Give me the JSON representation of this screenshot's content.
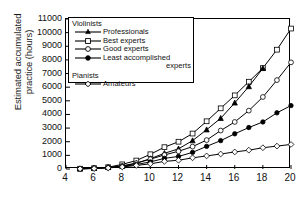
{
  "chart_data": {
    "type": "line",
    "title": "",
    "xlabel": "Age of the musicians (years)",
    "ylabel_line1": "Estimated accumulated",
    "ylabel_line2": "practice (hours)",
    "xlim": [
      4,
      20
    ],
    "ylim": [
      0,
      11000
    ],
    "xticks": [
      4,
      6,
      8,
      10,
      12,
      14,
      16,
      18,
      20
    ],
    "yticks": [
      0,
      1000,
      2000,
      3000,
      4000,
      5000,
      6000,
      7000,
      8000,
      9000,
      10000,
      11000
    ],
    "grid": false,
    "legend_position": "upper-left-inside",
    "x": [
      5,
      6,
      7,
      8,
      9,
      10,
      11,
      12,
      13,
      14,
      15,
      16,
      17,
      18,
      19,
      20
    ],
    "series": [
      {
        "name": "Best experts",
        "group": "Violinists",
        "marker": "open-square",
        "values": [
          20,
          60,
          130,
          340,
          620,
          1080,
          1600,
          2000,
          2600,
          3500,
          4450,
          5400,
          6400,
          7400,
          8750,
          10300
        ]
      },
      {
        "name": "Professionals",
        "group": "Violinists",
        "marker": "filled-triangle",
        "values": [
          20,
          55,
          120,
          200,
          420,
          760,
          1150,
          1480,
          2080,
          2880,
          3720,
          4850,
          6050,
          7380,
          null,
          null
        ]
      },
      {
        "name": "Good experts",
        "group": "Violinists",
        "marker": "open-circle",
        "values": [
          15,
          45,
          110,
          230,
          430,
          720,
          1030,
          1300,
          1640,
          2120,
          2820,
          3450,
          4280,
          5280,
          6520,
          7820
        ]
      },
      {
        "name": "Least accomplished experts",
        "group": "Violinists",
        "marker": "filled-circle",
        "values": [
          15,
          40,
          90,
          180,
          330,
          520,
          780,
          920,
          1220,
          1660,
          2080,
          2580,
          3040,
          3450,
          4120,
          4650
        ]
      },
      {
        "name": "Amateurs",
        "group": "Pianists",
        "marker": "open-diamond",
        "values": [
          15,
          35,
          80,
          150,
          260,
          380,
          560,
          640,
          820,
          960,
          1100,
          1250,
          1380,
          1560,
          1680,
          1800
        ]
      }
    ]
  },
  "legend": {
    "group1_label": "Violinists",
    "group2_label": "Pianists",
    "item1": "Professionals",
    "item2": "Best experts",
    "item3": "Good experts",
    "item4_line1": "Least accomplished",
    "item4_line2": "experts",
    "item5": "Amateurs"
  },
  "colors": {
    "line": "#000000",
    "axis": "#000000",
    "background": "#ffffff",
    "text": "#111111"
  }
}
